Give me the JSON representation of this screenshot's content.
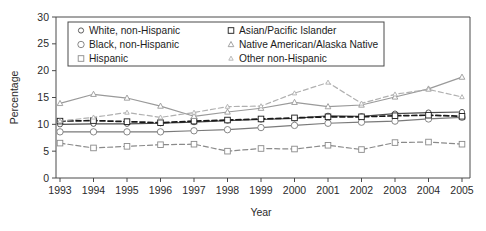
{
  "chart_data": {
    "type": "line",
    "title": "",
    "xlabel": "Year",
    "ylabel": "Percentage",
    "categories": [
      "1993",
      "1994",
      "1995",
      "1996",
      "1997",
      "1998",
      "1999",
      "2000",
      "2001",
      "2002",
      "2003",
      "2004",
      "2005"
    ],
    "x": [
      1993,
      1994,
      1995,
      1996,
      1997,
      1998,
      1999,
      2000,
      2001,
      2002,
      2003,
      2004,
      2005
    ],
    "xlim": [
      1993,
      2005
    ],
    "ylim": [
      0,
      30
    ],
    "yticks": [
      0,
      5,
      10,
      15,
      20,
      25,
      30
    ],
    "grid": false,
    "legend_position": "top-center-inside",
    "series": [
      {
        "name": "White, non-Hispanic",
        "marker": "circle-small",
        "linestyle": "solid",
        "color": "#4d4d4d",
        "values": [
          10.0,
          10.1,
          10.1,
          10.2,
          10.4,
          10.7,
          10.9,
          11.1,
          11.6,
          11.5,
          12.0,
          12.2,
          12.3
        ]
      },
      {
        "name": "Black, non-Hispanic",
        "marker": "circle",
        "linestyle": "solid",
        "color": "#7a7a7a",
        "values": [
          8.6,
          8.6,
          8.6,
          8.6,
          8.8,
          9.0,
          9.4,
          9.8,
          10.2,
          10.4,
          10.6,
          11.0,
          11.3
        ]
      },
      {
        "name": "Hispanic",
        "marker": "square",
        "linestyle": "dashed",
        "color": "#8a8a8a",
        "values": [
          6.5,
          5.6,
          5.9,
          6.2,
          6.3,
          5.0,
          5.5,
          5.4,
          6.1,
          5.3,
          6.6,
          6.7,
          6.3
        ]
      },
      {
        "name": "Asian/Pacific Islander",
        "marker": "square",
        "linestyle": "dashed",
        "color": "#1a1a1a",
        "values": [
          10.6,
          10.7,
          10.5,
          10.3,
          10.6,
          10.8,
          11.0,
          11.2,
          11.4,
          11.4,
          11.6,
          11.7,
          11.5
        ]
      },
      {
        "name": "Native American/Alaska Native",
        "marker": "triangle",
        "linestyle": "solid",
        "color": "#9a9a9a",
        "values": [
          13.9,
          15.6,
          14.9,
          13.4,
          11.5,
          12.3,
          13.0,
          14.1,
          13.3,
          13.6,
          15.1,
          16.6,
          18.8
        ]
      },
      {
        "name": "Other non-Hispanic",
        "marker": "triangle-small",
        "linestyle": "dashed",
        "color": "#b0b0b0",
        "values": [
          10.6,
          11.3,
          12.2,
          11.3,
          12.2,
          13.3,
          13.4,
          15.8,
          17.8,
          13.9,
          15.6,
          16.5,
          15.1
        ]
      }
    ]
  },
  "legend": {
    "items": [
      {
        "label": "White, non-Hispanic"
      },
      {
        "label": "Black, non-Hispanic"
      },
      {
        "label": "Hispanic"
      },
      {
        "label": "Asian/Pacific Islander"
      },
      {
        "label": "Native American/Alaska Native"
      },
      {
        "label": "Other non-Hispanic"
      }
    ]
  },
  "colors": {
    "axis": "#4a4a4a",
    "text": "#2b2b2b",
    "background": "#ffffff"
  }
}
